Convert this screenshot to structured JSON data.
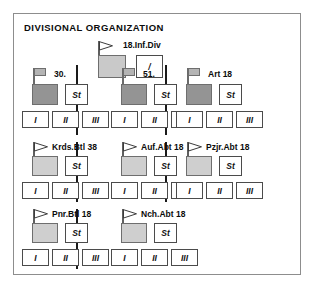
{
  "panel": {
    "title": "DIVISIONAL ORGANIZATION",
    "border_color": "#8d8d8d",
    "background": "#ffffff"
  },
  "colors": {
    "division_box": "#c9c9c9",
    "regiment_box": "#949494",
    "battalion_box": "#cfcfcf",
    "box_border": "#6e6e6e",
    "label_border": "#4b4b4b",
    "divider": "#1a1a1a",
    "text": "#0c0c0c"
  },
  "division": {
    "label": "18.Inf.Div",
    "flag_icon": "pennant-flag-icon",
    "hq_box": "",
    "staff_label": "/"
  },
  "regiments": [
    {
      "label": "30.",
      "flag_icon": "standard-flag-icon",
      "staff_label": "St",
      "battalions": [
        "I",
        "II",
        "III"
      ]
    },
    {
      "label": "51.",
      "flag_icon": "standard-flag-icon",
      "staff_label": "St",
      "battalions": [
        "I",
        "II",
        "III"
      ]
    },
    {
      "label": "Art 18",
      "flag_icon": "standard-flag-icon",
      "staff_label": "St",
      "battalions": [
        "I",
        "II",
        "III"
      ]
    }
  ],
  "independent_units_row1": [
    {
      "label": "Krds.Btl 38",
      "flag_icon": "pennant-flag-icon",
      "staff_label": "St",
      "battalions": [
        "I",
        "II",
        "III"
      ]
    },
    {
      "label": "Auf.Abt 18",
      "flag_icon": "pennant-flag-icon",
      "staff_label": "St",
      "battalions": [
        "I",
        "II",
        "III"
      ]
    },
    {
      "label": "Pzjr.Abt 18",
      "flag_icon": "pennant-flag-icon",
      "staff_label": "St",
      "battalions": [
        "I",
        "II",
        "III"
      ]
    }
  ],
  "independent_units_row2": [
    {
      "label": "Pnr.Btl 18",
      "flag_icon": "pennant-flag-icon",
      "staff_label": "St",
      "battalions": [
        "I",
        "II",
        "III"
      ]
    },
    {
      "label": "Nch.Abt 18",
      "flag_icon": "pennant-flag-icon",
      "staff_label": "St",
      "battalions": [
        "I",
        "II",
        "III"
      ]
    }
  ]
}
